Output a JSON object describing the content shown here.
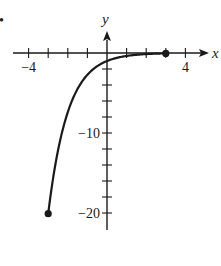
{
  "problem_marker": "•",
  "chart_data": {
    "type": "line",
    "title": "",
    "xlabel": "x",
    "ylabel": "y",
    "function": "y = -e^(-x)",
    "domain": [
      -3,
      3
    ],
    "xlim": [
      -4,
      5
    ],
    "ylim": [
      -22,
      2
    ],
    "x_ticks": [
      -4,
      -3,
      -2,
      -1,
      0,
      1,
      2,
      3,
      4
    ],
    "x_tick_labels": [
      "-4",
      "4"
    ],
    "y_ticks": [
      0,
      -2,
      -4,
      -6,
      -8,
      -10,
      -12,
      -14,
      -16,
      -18,
      -20
    ],
    "y_tick_labels": [
      "-10",
      "-20"
    ],
    "endpoints": [
      {
        "x": -3,
        "y": -20.09,
        "closed": true
      },
      {
        "x": 3,
        "y": -0.05,
        "closed": true
      }
    ],
    "series": [
      {
        "name": "curve",
        "x": [
          -3,
          -2.5,
          -2,
          -1.5,
          -1,
          -0.5,
          0,
          0.5,
          1,
          1.5,
          2,
          2.5,
          3
        ],
        "values": [
          -20.09,
          -12.18,
          -7.39,
          -4.48,
          -2.72,
          -1.65,
          -1.0,
          -0.61,
          -0.37,
          -0.22,
          -0.14,
          -0.08,
          -0.05
        ]
      }
    ],
    "grid": false,
    "legend": null
  },
  "colors": {
    "ink": "#1a1a1a",
    "background": "#ffffff"
  }
}
